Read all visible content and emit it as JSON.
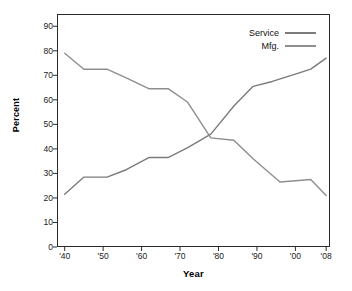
{
  "chart_data": {
    "type": "line",
    "title": "",
    "xlabel": "Year",
    "ylabel": "Percent",
    "xlim": [
      1938,
      2009
    ],
    "ylim": [
      0,
      95
    ],
    "grid": false,
    "legend_position": "top-right",
    "x_tick_labels": [
      "'40",
      "'50",
      "'60",
      "'70",
      "'80",
      "'90",
      "'00",
      "'08"
    ],
    "x_tick_values": [
      1940,
      1950,
      1960,
      1970,
      1980,
      1990,
      2000,
      2008
    ],
    "y_tick_labels": [
      "0",
      "10",
      "20",
      "30",
      "40",
      "50",
      "60",
      "70",
      "80",
      "90"
    ],
    "y_tick_values": [
      0,
      10,
      20,
      30,
      40,
      50,
      60,
      70,
      80,
      90
    ],
    "series": [
      {
        "name": "Service",
        "color": "#7b7b7b",
        "x": [
          1940,
          1945,
          1951,
          1956,
          1962,
          1967,
          1972,
          1978,
          1984,
          1989,
          1994,
          2000,
          2004,
          2008
        ],
        "values": [
          21.5,
          28.5,
          28.5,
          31.5,
          36.5,
          36.5,
          40.5,
          46.0,
          57.5,
          65.5,
          67.5,
          70.5,
          72.5,
          77.0
        ]
      },
      {
        "name": "Mfg.",
        "color": "#8e8e8e",
        "x": [
          1940,
          1945,
          1951,
          1956,
          1962,
          1967,
          1972,
          1978,
          1984,
          1989,
          1996,
          2004,
          2008
        ],
        "values": [
          79.0,
          72.5,
          72.5,
          69.0,
          64.5,
          64.5,
          59.0,
          44.5,
          43.5,
          36.0,
          26.5,
          27.5,
          21.0
        ]
      }
    ]
  },
  "legend": {
    "items": [
      {
        "label": "Service"
      },
      {
        "label": "Mfg."
      }
    ]
  },
  "axes": {
    "x_title": "Year",
    "y_title": "Percent"
  }
}
